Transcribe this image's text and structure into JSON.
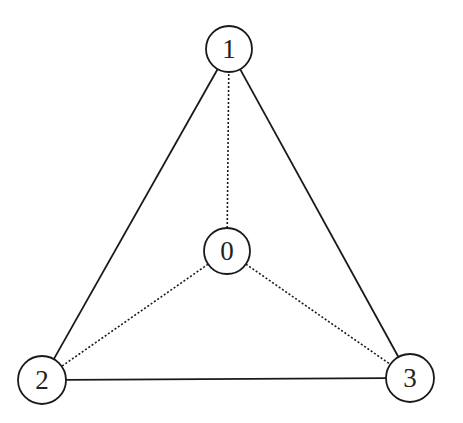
{
  "diagram": {
    "type": "graph",
    "colors": {
      "stroke": "#1a1a1a",
      "fill": "#ffffff",
      "text": "#222222"
    },
    "nodes": [
      {
        "id": "0",
        "label": "0",
        "x": 227,
        "y": 251,
        "r": 23
      },
      {
        "id": "1",
        "label": "1",
        "x": 229,
        "y": 49,
        "r": 23
      },
      {
        "id": "2",
        "label": "2",
        "x": 42,
        "y": 380,
        "r": 24
      },
      {
        "id": "3",
        "label": "3",
        "x": 410,
        "y": 378,
        "r": 24
      }
    ],
    "edges": [
      {
        "from": "1",
        "to": "2",
        "style": "solid"
      },
      {
        "from": "1",
        "to": "3",
        "style": "solid"
      },
      {
        "from": "2",
        "to": "3",
        "style": "solid"
      },
      {
        "from": "0",
        "to": "1",
        "style": "dotted"
      },
      {
        "from": "0",
        "to": "2",
        "style": "dotted"
      },
      {
        "from": "0",
        "to": "3",
        "style": "dotted"
      }
    ]
  }
}
